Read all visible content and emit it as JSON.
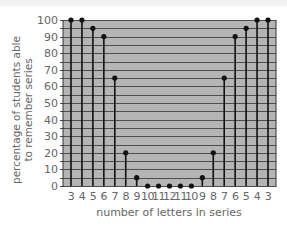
{
  "chart_data": {
    "type": "bar",
    "style": "lollipop",
    "title": "",
    "xlabel": "number of letters in series",
    "ylabel": "percentage of students able to remember series",
    "ylabel_lines": [
      "percentage of students able",
      "to remember series"
    ],
    "categories": [
      "3",
      "4",
      "5",
      "6",
      "7",
      "8",
      "9",
      "10",
      "11",
      "12",
      "11",
      "10",
      "9",
      "8",
      "7",
      "6",
      "5",
      "4",
      "3"
    ],
    "values": [
      100,
      100,
      95,
      90,
      65,
      20,
      5,
      0,
      0,
      0,
      0,
      0,
      5,
      20,
      65,
      90,
      95,
      100,
      100
    ],
    "ylim": [
      0,
      100
    ],
    "yticks": [
      0,
      10,
      20,
      30,
      40,
      50,
      60,
      70,
      80,
      90,
      100
    ],
    "grid": {
      "horizontal": true,
      "vertical": false,
      "step": 5
    },
    "colors": {
      "plot_bg": "#b5b5b5",
      "gridline": "#4d4d4d",
      "stem": "#111111",
      "marker": "#111111"
    }
  }
}
